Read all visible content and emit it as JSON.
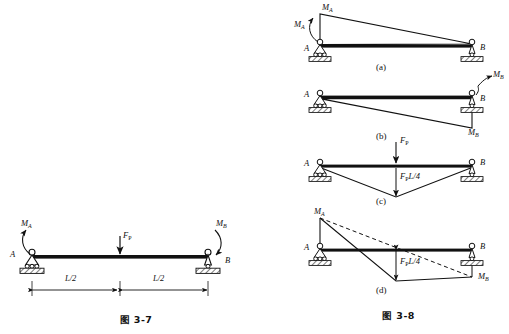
{
  "page": {
    "background_color": "#ffffff",
    "ink_color": "#111111",
    "width": 509,
    "height": 334
  },
  "figures": [
    {
      "id": "fig-3-7",
      "caption": "图 3-7",
      "description": "Simply supported beam with end moments M_A, M_B and a central concentrated load F_P, span divided into L/2 and L/2",
      "labels": {
        "moment_left": "M",
        "moment_left_sub": "A",
        "moment_right": "M",
        "moment_right_sub": "B",
        "support_left": "A",
        "support_right": "B",
        "load": "F",
        "load_sub": "P",
        "dim_left": "L/2",
        "dim_right": "L/2"
      }
    },
    {
      "id": "fig-3-8",
      "caption": "图 3-8",
      "panels": [
        {
          "tag": "(a)",
          "description": "Bending moment diagram due to end moment M_A alone: triangle with ordinate M_A at support A tapering to zero at B",
          "labels": {
            "applied_moment": "M",
            "applied_moment_sub": "A",
            "ordinate": "M",
            "ordinate_sub": "A",
            "support_left": "A",
            "support_right": "B"
          }
        },
        {
          "tag": "(b)",
          "description": "Bending moment diagram due to end moment M_B alone: triangle with ordinate M_B at support B tapering to zero at A, drawn below the beam axis",
          "labels": {
            "applied_moment": "M",
            "applied_moment_sub": "B",
            "ordinate": "M",
            "ordinate_sub": "B",
            "support_left": "A",
            "support_right": "B"
          }
        },
        {
          "tag": "(c)",
          "description": "Bending moment diagram due to central load F_P alone: triangle with peak ordinate F_P L/4 at midspan",
          "labels": {
            "load": "F",
            "load_sub": "P",
            "ordinate_pre": "F",
            "ordinate_sub": "P",
            "ordinate_post": "L/4",
            "support_left": "A",
            "support_right": "B"
          }
        },
        {
          "tag": "(d)",
          "description": "Superposed bending moment diagram combining M_A, M_B and F_P L/4; dashed line is the end-moment baseline",
          "labels": {
            "moment_left": "M",
            "moment_left_sub": "A",
            "moment_right": "M",
            "moment_right_sub": "B",
            "ordinate_pre": "F",
            "ordinate_sub": "P",
            "ordinate_post": "L/4",
            "support_left": "A",
            "support_right": "B"
          }
        }
      ]
    }
  ]
}
